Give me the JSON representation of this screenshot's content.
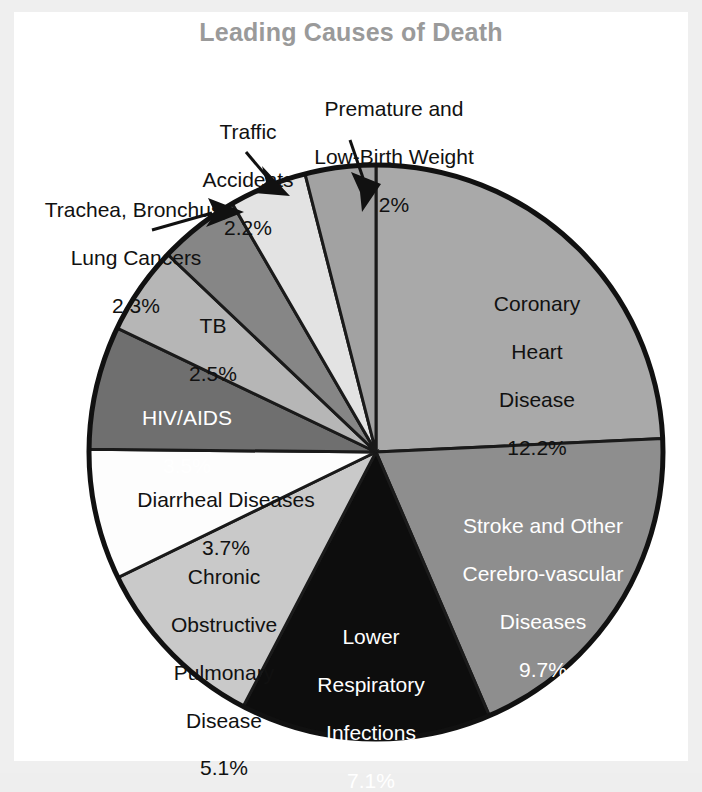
{
  "chart_data": {
    "type": "pie",
    "title": "Leading Causes of Death",
    "xlabel": "",
    "ylabel": "",
    "legend": "none",
    "value_unit": "percent of all deaths",
    "note": "Slice labels are placed inside or outside the pie; outside labels use leader lines with arrowheads.",
    "categories": [
      "Coronary Heart Disease",
      "Stroke and Other Cerebro-vascular Diseases",
      "Lower Respiratory Infections",
      "Chronic Obstructive Pulmonary Disease",
      "Diarrheal Diseases",
      "HIV/AIDS",
      "TB",
      "Trachea, Bronchus, Lung Cancers",
      "Traffic Accidents",
      "Premature and Low-Birth Weight"
    ],
    "values": [
      12.2,
      9.7,
      7.1,
      5.1,
      3.7,
      3.5,
      2.5,
      2.3,
      2.2,
      2.0
    ],
    "value_labels": [
      "12.2%",
      "9.7%",
      "7.1%",
      "5.1%",
      "3.7%",
      "3.5%",
      "2.5%",
      "2.3%",
      "2.2%",
      "2%"
    ],
    "colors": [
      "#a9a9a9",
      "#8e8e8e",
      "#0d0d0d",
      "#c9c9c9",
      "#fdfdfd",
      "#6f6f6f",
      "#b6b6b6",
      "#868686",
      "#e3e3e3",
      "#a2a2a2"
    ],
    "slices": [
      {
        "label": "Coronary Heart Disease",
        "value": 12.2,
        "value_label": "12.2%",
        "color": "#a9a9a9",
        "label_color": "dark",
        "label_placement": "inside"
      },
      {
        "label": "Stroke and Other Cerebro-vascular Diseases",
        "value": 9.7,
        "value_label": "9.7%",
        "color": "#8e8e8e",
        "label_color": "white",
        "label_placement": "inside"
      },
      {
        "label": "Lower Respiratory Infections",
        "value": 7.1,
        "value_label": "7.1%",
        "color": "#0d0d0d",
        "label_color": "white",
        "label_placement": "inside"
      },
      {
        "label": "Chronic Obstructive Pulmonary Disease",
        "value": 5.1,
        "value_label": "5.1%",
        "color": "#c9c9c9",
        "label_color": "dark",
        "label_placement": "inside"
      },
      {
        "label": "Diarrheal Diseases",
        "value": 3.7,
        "value_label": "3.7%",
        "color": "#fdfdfd",
        "label_color": "dark",
        "label_placement": "inside"
      },
      {
        "label": "HIV/AIDS",
        "value": 3.5,
        "value_label": "3.5%",
        "color": "#6f6f6f",
        "label_color": "white",
        "label_placement": "inside"
      },
      {
        "label": "TB",
        "value": 2.5,
        "value_label": "2.5%",
        "color": "#b6b6b6",
        "label_color": "dark",
        "label_placement": "inside"
      },
      {
        "label": "Trachea, Bronchus, Lung Cancers",
        "value": 2.3,
        "value_label": "2.3%",
        "color": "#868686",
        "label_color": "dark",
        "label_placement": "outside-left"
      },
      {
        "label": "Traffic Accidents",
        "value": 2.2,
        "value_label": "2.2%",
        "color": "#e3e3e3",
        "label_color": "dark",
        "label_placement": "outside-top"
      },
      {
        "label": "Premature and Low-Birth Weight",
        "value": 2.0,
        "value_label": "2%",
        "color": "#a2a2a2",
        "label_color": "dark",
        "label_placement": "outside-top"
      }
    ]
  },
  "title": {
    "text": "Leading Causes of Death",
    "color": "#9a9a9a"
  },
  "labels": {
    "coronary": {
      "line1": "Coronary",
      "line2": "Heart",
      "line3": "Disease",
      "pct": "12.2%"
    },
    "stroke": {
      "line1": "Stroke and Other",
      "line2": "Cerebro-vascular",
      "line3": "Diseases",
      "pct": "9.7%"
    },
    "lri": {
      "line1": "Lower",
      "line2": "Respiratory",
      "line3": "Infections",
      "pct": "7.1%"
    },
    "copd": {
      "line1": "Chronic",
      "line2": "Obstructive",
      "line3": "Pulmonary",
      "line4": "Disease",
      "pct": "5.1%"
    },
    "diarrheal": {
      "line1": "Diarrheal Diseases",
      "pct": "3.7%"
    },
    "hiv": {
      "line1": "HIV/AIDS",
      "pct": "3.5%"
    },
    "tb": {
      "line1": "TB",
      "pct": "2.5%"
    },
    "trachea": {
      "line1": "Trachea, Bronchus,",
      "line2": "Lung Cancers",
      "pct": "2.3%"
    },
    "traffic": {
      "line1": "Traffic",
      "line2": "Accidents",
      "pct": "2.2%"
    },
    "premature": {
      "line1": "Premature and",
      "line2": "Low-Birth Weight",
      "pct": "2%"
    }
  },
  "colors": {
    "page_background": "#efefef",
    "canvas": "#ffffff",
    "outline": "#111111",
    "title": "#9a9a9a"
  }
}
